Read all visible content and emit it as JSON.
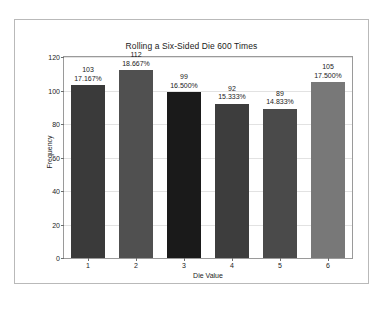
{
  "chart_data": {
    "type": "bar",
    "title": "Rolling a Six-Sided Die 600 Times",
    "xlabel": "Die Value",
    "ylabel": "Frequency",
    "categories": [
      "1",
      "2",
      "3",
      "4",
      "5",
      "6"
    ],
    "values": [
      103,
      112,
      99,
      92,
      89,
      105
    ],
    "bar_labels": [
      {
        "count": "103",
        "percent": "17.167%"
      },
      {
        "count": "112",
        "percent": "18.667%"
      },
      {
        "count": "99",
        "percent": "16.500%"
      },
      {
        "count": "92",
        "percent": "15.333%"
      },
      {
        "count": "89",
        "percent": "14.833%"
      },
      {
        "count": "105",
        "percent": "17.500%"
      }
    ],
    "bar_colors": [
      "#3a3a3a",
      "#505050",
      "#1a1a1a",
      "#3d3d3d",
      "#4a4a4a",
      "#787878"
    ],
    "ylim": [
      0,
      120
    ],
    "yticks": [
      "0",
      "20",
      "40",
      "60",
      "80",
      "100",
      "120"
    ],
    "ytick_values": [
      0,
      20,
      40,
      60,
      80,
      100,
      120
    ],
    "xticks": [
      "1",
      "2",
      "3",
      "4",
      "5",
      "6"
    ],
    "grid": true,
    "legend": "none",
    "total_rolls": 600
  },
  "figure": {
    "background": "#ffffff",
    "border_color": "#b9b9b9",
    "axes_border_color": "#9a9a9a",
    "gridline_color": "#e2e2e2",
    "text_color": "#1b1b1b"
  }
}
